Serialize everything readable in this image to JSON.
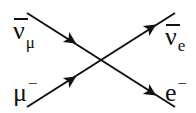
{
  "diagram": {
    "type": "feynman-diagram",
    "vertex": {
      "x": 100,
      "y": 60
    },
    "lines": [
      {
        "id": "antinu-mu-in",
        "from": [
          27,
          13
        ],
        "to": [
          100,
          60
        ],
        "arrow_at": [
          63,
          36
        ],
        "direction": "in"
      },
      {
        "id": "muon-in",
        "from": [
          27,
          107
        ],
        "to": [
          100,
          60
        ],
        "arrow_at": [
          63,
          84
        ],
        "direction": "in"
      },
      {
        "id": "antinu-e-out",
        "from": [
          100,
          60
        ],
        "to": [
          175,
          13
        ],
        "arrow_at": [
          145,
          32
        ],
        "direction": "out"
      },
      {
        "id": "electron-out",
        "from": [
          100,
          60
        ],
        "to": [
          175,
          107
        ],
        "arrow_at": [
          145,
          88
        ],
        "direction": "out"
      }
    ],
    "labels": {
      "top_left": {
        "main": "ν",
        "overbar": true,
        "sub": "μ",
        "sup": ""
      },
      "bottom_left": {
        "main": "μ",
        "overbar": false,
        "sub": "",
        "sup": "−"
      },
      "top_right": {
        "main": "ν",
        "overbar": true,
        "sub": "e",
        "sup": ""
      },
      "bottom_right": {
        "main": "e",
        "overbar": false,
        "sub": "",
        "sup": "−"
      }
    },
    "colors": {
      "line": "#111111",
      "background": "#ffffff"
    }
  }
}
